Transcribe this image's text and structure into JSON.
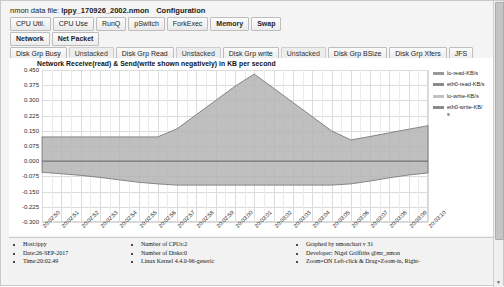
{
  "header": {
    "data_file_label": "nmon data file:",
    "data_file_name": "lppy_170926_2002.nmon",
    "configuration_label": "Configuration"
  },
  "tabs": {
    "row1": [
      "CPU Util.",
      "CPU Use",
      "RunQ",
      "pSwitch",
      "ForkExec",
      "Memory",
      "Swap"
    ],
    "row2": [
      "Network",
      "Net Packet"
    ],
    "row3": [
      "Disk Grp Busy",
      "Unstacked",
      "Disk Grp Read",
      "Unstacked",
      "Disk Grp write",
      "Unstacked",
      "Disk Grp BSize",
      "Disk Grp Xfers",
      "JFS"
    ]
  },
  "chart_data": {
    "type": "area",
    "title": "Network Receive(read) & Send(write shown negatively) in KB per second",
    "xlabel": "",
    "ylabel": "",
    "ylim": [
      -0.3,
      0.45
    ],
    "yticks": [
      "0.450",
      "0.375",
      "0.300",
      "0.225",
      "0.150",
      "0.075",
      "0.000",
      "-0.075",
      "-0.150",
      "-0.225",
      "-0.300"
    ],
    "ytick_values": [
      0.45,
      0.375,
      0.3,
      0.225,
      0.15,
      0.075,
      0.0,
      -0.075,
      -0.15,
      -0.225,
      -0.3
    ],
    "grid": true,
    "legend_position": "right",
    "x": [
      "20:02:50",
      "20:02:51",
      "20:02:52",
      "20:02:53",
      "20:02:54",
      "20:02:55",
      "20:02:56",
      "20:02:57",
      "20:02:58",
      "20:02:59",
      "20:03:00",
      "20:03:01",
      "20:03:02",
      "20:03:03",
      "20:03:04",
      "20:03:05",
      "20:03:06",
      "20:03:07",
      "20:03:08",
      "20:03:09",
      "20:03:10"
    ],
    "series": [
      {
        "name": "lo-read-KB/s",
        "color": "#9a9a9a",
        "values": [
          0,
          0,
          0,
          0,
          0,
          0,
          0,
          0,
          0,
          0,
          0,
          0,
          0,
          0,
          0,
          0,
          0,
          0,
          0,
          0,
          0
        ]
      },
      {
        "name": "eth0-read-KB/s",
        "color": "#8c8c8c",
        "values": [
          0.12,
          0.12,
          0.12,
          0.12,
          0.12,
          0.12,
          0.12,
          0.16,
          0.23,
          0.3,
          0.37,
          0.43,
          0.36,
          0.29,
          0.22,
          0.15,
          0.105,
          0.122,
          0.14,
          0.158,
          0.175
        ]
      },
      {
        "name": "lo-write-KB/s",
        "color": "#c2c2c2",
        "values": [
          0,
          0,
          0,
          0,
          0,
          0,
          0,
          0,
          0,
          0,
          0,
          0,
          0,
          0,
          0,
          0,
          0,
          0,
          0,
          0,
          0
        ]
      },
      {
        "name": "eth0-write-KB/s",
        "color": "#8c8c8c",
        "values": [
          -0.055,
          -0.062,
          -0.07,
          -0.08,
          -0.092,
          -0.104,
          -0.112,
          -0.118,
          -0.118,
          -0.118,
          -0.118,
          -0.118,
          -0.118,
          -0.118,
          -0.118,
          -0.118,
          -0.112,
          -0.098,
          -0.082,
          -0.068,
          -0.058
        ]
      }
    ]
  },
  "footer": {
    "col1": [
      "Host:ippy",
      "Date:26-SEP-2017",
      "Time:20:02.49"
    ],
    "col2": [
      "Number of CPUs:2",
      "Number of Disks:0",
      "Linux Kernel 4.4.0-96-generic"
    ],
    "col3": [
      "Graphed by nmonchart v 31",
      "Developer: Nigel Griffiths @mr_nmon",
      "Zoom=ON Left-click & Drag=Zoom-in, Right-"
    ]
  }
}
